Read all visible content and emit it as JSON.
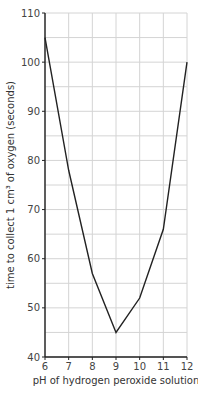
{
  "chart_data": {
    "type": "line",
    "title": "",
    "xlabel": "pH of hydrogen peroxide solution",
    "ylabel": "time to collect 1 cm³ of oxygen (seconds)",
    "x": [
      6,
      7,
      8,
      9,
      10,
      11,
      12
    ],
    "series": [
      {
        "name": "time",
        "values": [
          105,
          78,
          57,
          45,
          52,
          66,
          100
        ]
      }
    ],
    "xlim": [
      6,
      12
    ],
    "ylim": [
      40,
      110
    ],
    "xticks": [
      6,
      7,
      8,
      9,
      10,
      11,
      12
    ],
    "yticks": [
      40,
      50,
      60,
      70,
      80,
      90,
      100,
      110
    ],
    "grid": {
      "x_step": 1,
      "y_step": 5
    },
    "legend": null,
    "colors": {
      "line": "#222222",
      "grid": "#d4d4d4",
      "axis": "#222222"
    }
  }
}
